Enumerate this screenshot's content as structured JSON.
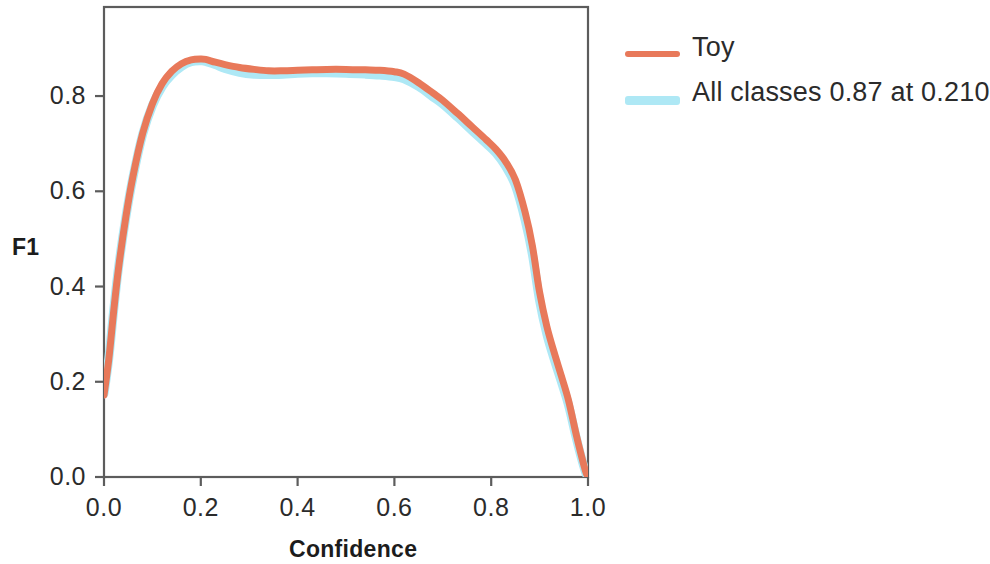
{
  "chart_data": {
    "type": "line",
    "title": "",
    "xlabel": "Confidence",
    "ylabel": "F1",
    "xlim": [
      0.0,
      1.0
    ],
    "ylim": [
      0.0,
      0.99
    ],
    "grid": false,
    "legend_position": "right-outside",
    "xticks": [
      "0.0",
      "0.2",
      "0.4",
      "0.6",
      "0.8",
      "1.0"
    ],
    "xtick_values": [
      0.0,
      0.2,
      0.4,
      0.6,
      0.8,
      1.0
    ],
    "yticks": [
      "0.0",
      "0.2",
      "0.4",
      "0.6",
      "0.8"
    ],
    "ytick_values": [
      0.0,
      0.2,
      0.4,
      0.6,
      0.8
    ],
    "series": [
      {
        "name": "All classes 0.87 at 0.210",
        "color": "#AEE8F5",
        "linewidth": 9,
        "x": [
          0.0,
          0.01,
          0.02,
          0.03,
          0.045,
          0.06,
          0.08,
          0.1,
          0.12,
          0.14,
          0.16,
          0.18,
          0.2,
          0.21,
          0.23,
          0.25,
          0.28,
          0.31,
          0.34,
          0.37,
          0.4,
          0.43,
          0.46,
          0.5,
          0.54,
          0.57,
          0.6,
          0.62,
          0.65,
          0.68,
          0.7,
          0.73,
          0.76,
          0.79,
          0.81,
          0.83,
          0.85,
          0.87,
          0.885,
          0.9,
          0.915,
          0.93,
          0.945,
          0.96,
          0.975,
          0.985,
          0.995,
          1.0
        ],
        "y": [
          0.175,
          0.25,
          0.35,
          0.44,
          0.545,
          0.63,
          0.72,
          0.78,
          0.82,
          0.845,
          0.862,
          0.872,
          0.874,
          0.873,
          0.866,
          0.858,
          0.85,
          0.846,
          0.845,
          0.846,
          0.848,
          0.849,
          0.849,
          0.848,
          0.846,
          0.844,
          0.841,
          0.836,
          0.82,
          0.798,
          0.783,
          0.756,
          0.728,
          0.7,
          0.68,
          0.652,
          0.612,
          0.54,
          0.468,
          0.37,
          0.3,
          0.248,
          0.2,
          0.15,
          0.085,
          0.045,
          0.01,
          0.0
        ]
      },
      {
        "name": "Toy",
        "color": "#E8795A",
        "linewidth": 7,
        "x": [
          0.0,
          0.01,
          0.02,
          0.03,
          0.045,
          0.06,
          0.08,
          0.1,
          0.12,
          0.14,
          0.16,
          0.18,
          0.2,
          0.21,
          0.23,
          0.25,
          0.28,
          0.31,
          0.34,
          0.37,
          0.4,
          0.43,
          0.46,
          0.5,
          0.54,
          0.57,
          0.6,
          0.62,
          0.65,
          0.68,
          0.7,
          0.73,
          0.76,
          0.79,
          0.81,
          0.83,
          0.85,
          0.87,
          0.885,
          0.9,
          0.915,
          0.93,
          0.945,
          0.96,
          0.975,
          0.985,
          0.995,
          1.0
        ],
        "y": [
          0.172,
          0.248,
          0.348,
          0.438,
          0.545,
          0.632,
          0.722,
          0.784,
          0.826,
          0.852,
          0.868,
          0.876,
          0.878,
          0.877,
          0.871,
          0.866,
          0.86,
          0.856,
          0.853,
          0.853,
          0.854,
          0.855,
          0.856,
          0.856,
          0.855,
          0.854,
          0.851,
          0.846,
          0.828,
          0.806,
          0.791,
          0.764,
          0.736,
          0.708,
          0.688,
          0.662,
          0.624,
          0.556,
          0.486,
          0.388,
          0.316,
          0.262,
          0.212,
          0.16,
          0.092,
          0.05,
          0.012,
          0.0
        ]
      }
    ]
  },
  "axes": {
    "x_title": "Confidence",
    "y_title": "F1"
  },
  "legend": {
    "entries": [
      {
        "label": "Toy",
        "color": "#E8795A"
      },
      {
        "label": "All classes 0.87 at 0.210",
        "color": "#AEE8F5"
      }
    ]
  },
  "layout": {
    "plot_left": 104,
    "plot_right": 588,
    "plot_top": 7,
    "plot_bottom": 477,
    "y_value_at_top": 0.987,
    "axis_color": "#5c5c5c"
  }
}
